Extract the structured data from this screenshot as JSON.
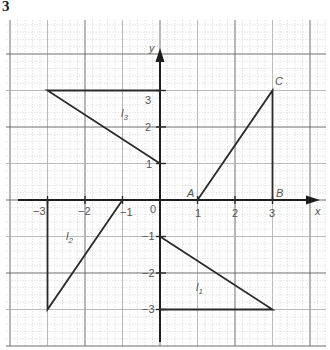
{
  "figure": {
    "number": "3",
    "axes": {
      "x_label": "x",
      "y_label": "y",
      "origin_label": "0",
      "x_ticks": [
        {
          "value": -3,
          "label": "−3"
        },
        {
          "value": -2,
          "label": "−2"
        },
        {
          "value": -1,
          "label": "−1"
        },
        {
          "value": 1,
          "label": "1"
        },
        {
          "value": 2,
          "label": "2"
        },
        {
          "value": 3,
          "label": "3"
        }
      ],
      "y_ticks": [
        {
          "value": 3,
          "label": "3"
        },
        {
          "value": 2,
          "label": "2"
        },
        {
          "value": 1,
          "label": "1"
        },
        {
          "value": -1,
          "label": "−1"
        },
        {
          "value": -2,
          "label": "−2"
        },
        {
          "value": -3,
          "label": "−3"
        }
      ]
    },
    "shapes": {
      "triangle_ABC": {
        "vertices": [
          {
            "name": "A",
            "x": 1,
            "y": 0
          },
          {
            "name": "B",
            "x": 3,
            "y": 0
          },
          {
            "name": "C",
            "x": 3,
            "y": 3
          }
        ]
      },
      "l1": {
        "label": "l₁",
        "vertices": [
          [
            0,
            -1
          ],
          [
            0,
            -3
          ],
          [
            3,
            -3
          ]
        ]
      },
      "l2": {
        "label": "l₂",
        "vertices": [
          [
            -3,
            0
          ],
          [
            -3,
            -3
          ],
          [
            -1,
            0
          ]
        ]
      },
      "l3": {
        "label": "l₃",
        "vertices": [
          [
            -3,
            3
          ],
          [
            0,
            3
          ],
          [
            0,
            1
          ]
        ]
      }
    },
    "labels": {
      "A": "A",
      "B": "B",
      "C": "C",
      "l1": "l",
      "l1_sub": "1",
      "l2": "l",
      "l2_sub": "2",
      "l3": "l",
      "l3_sub": "3"
    },
    "colors": {
      "line": "#2a2a2a",
      "axis": "#1e1e1e",
      "grid_major": "#6e6e6e",
      "grid_minor": "#c8c8c8",
      "label": "#555555"
    }
  }
}
